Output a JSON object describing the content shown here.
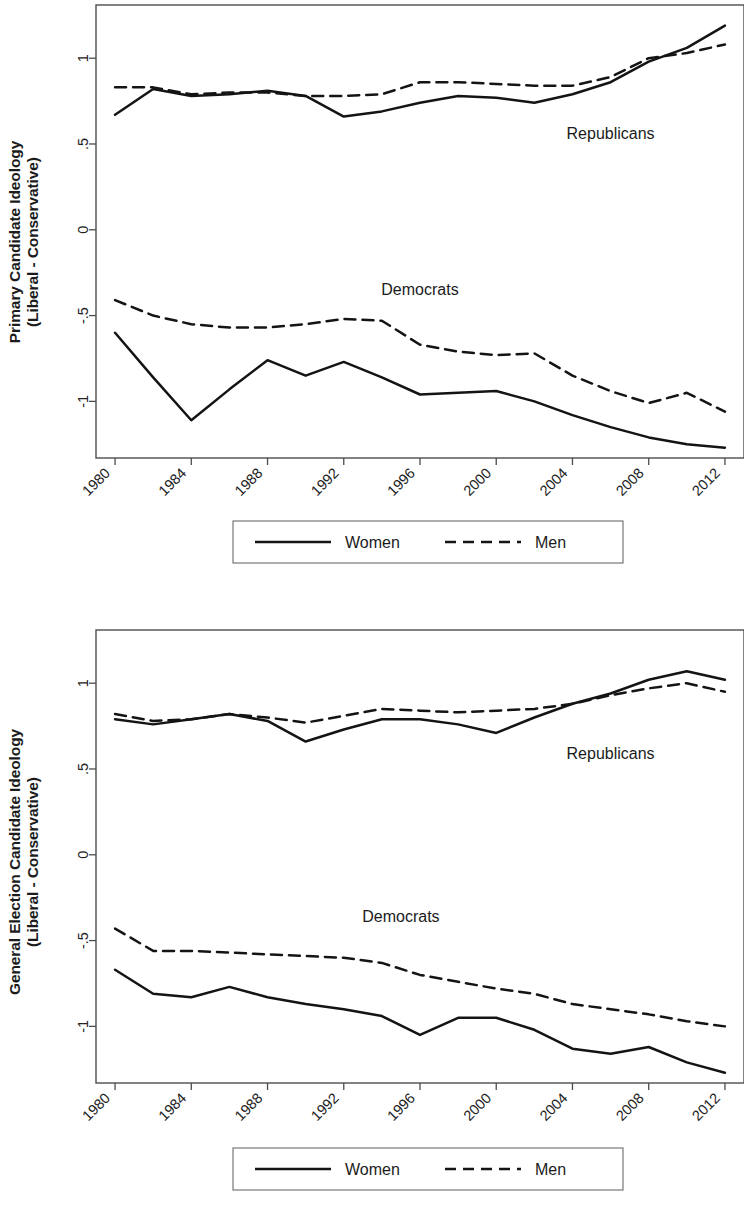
{
  "figure": {
    "background": "#ffffff",
    "line_color": "#141414",
    "frame_color": "#4d4d4d"
  },
  "panels": [
    {
      "id": "primary",
      "ylabel_line1": "Primary Candidate Ideology",
      "ylabel_line2": "(Liberal - Conservative)",
      "annotations": {
        "republicans": "Republicans",
        "democrats": "Democrats"
      },
      "legend": {
        "women": "Women",
        "men": "Men"
      },
      "yticks": [
        "1",
        ".5",
        "0",
        "-.5",
        "-1"
      ],
      "xticks": [
        "1980",
        "1984",
        "1988",
        "1992",
        "1996",
        "2000",
        "2004",
        "2008",
        "2012"
      ]
    },
    {
      "id": "general",
      "ylabel_line1": "General Election Candidate Ideology",
      "ylabel_line2": "(Liberal - Conservative)",
      "annotations": {
        "republicans": "Republicans",
        "democrats": "Democrats"
      },
      "legend": {
        "women": "Women",
        "men": "Men"
      },
      "yticks": [
        "1",
        ".5",
        "0",
        "-.5",
        "-1"
      ],
      "xticks": [
        "1980",
        "1984",
        "1988",
        "1992",
        "1996",
        "2000",
        "2004",
        "2008",
        "2012"
      ]
    }
  ],
  "chart_data": [
    {
      "type": "line",
      "title": "Primary Candidate Ideology (Liberal - Conservative)",
      "xlabel": "",
      "ylabel": "Primary Candidate Ideology (Liberal - Conservative)",
      "x": [
        1980,
        1982,
        1984,
        1986,
        1988,
        1990,
        1992,
        1994,
        1996,
        1998,
        2000,
        2002,
        2004,
        2006,
        2008,
        2010,
        2012
      ],
      "xlim": [
        1979,
        2013
      ],
      "ylim": [
        -1.33,
        1.31
      ],
      "yticks": [
        1,
        0.5,
        0,
        -0.5,
        -1
      ],
      "ytick_labels": [
        "1",
        ".5",
        "0",
        "-.5",
        "-1"
      ],
      "xticks": [
        1980,
        1984,
        1988,
        1992,
        1996,
        2000,
        2004,
        2008,
        2012
      ],
      "grid": false,
      "legend_position": "below-axes",
      "annotations": [
        {
          "text": "Republicans",
          "x": 2006,
          "y": 0.53
        },
        {
          "text": "Democrats",
          "x": 1996,
          "y": -0.38
        }
      ],
      "series": [
        {
          "name": "Republican Women",
          "group": "Republicans",
          "style": "solid",
          "legend": "Women",
          "values": [
            0.67,
            0.82,
            0.78,
            0.79,
            0.81,
            0.78,
            0.66,
            0.69,
            0.74,
            0.78,
            0.77,
            0.74,
            0.79,
            0.86,
            0.98,
            1.06,
            1.19
          ]
        },
        {
          "name": "Republican Men",
          "group": "Republicans",
          "style": "dashed",
          "legend": "Men",
          "values": [
            0.83,
            0.83,
            0.79,
            0.8,
            0.8,
            0.78,
            0.78,
            0.79,
            0.86,
            0.86,
            0.85,
            0.84,
            0.84,
            0.89,
            1.0,
            1.03,
            1.08
          ]
        },
        {
          "name": "Democratic Women",
          "group": "Democrats",
          "style": "solid",
          "legend": "Women",
          "values": [
            -0.6,
            -0.86,
            -1.11,
            -0.93,
            -0.76,
            -0.85,
            -0.77,
            -0.86,
            -0.96,
            -0.95,
            -0.94,
            -1.0,
            -1.08,
            -1.15,
            -1.21,
            -1.25,
            -1.27
          ]
        },
        {
          "name": "Democratic Men",
          "group": "Democrats",
          "style": "dashed",
          "legend": "Men",
          "values": [
            -0.41,
            -0.5,
            -0.55,
            -0.57,
            -0.57,
            -0.55,
            -0.52,
            -0.53,
            -0.67,
            -0.71,
            -0.73,
            -0.72,
            -0.85,
            -0.94,
            -1.01,
            -0.95,
            -1.06
          ]
        }
      ]
    },
    {
      "type": "line",
      "title": "General Election Candidate Ideology (Liberal - Conservative)",
      "xlabel": "",
      "ylabel": "General Election Candidate Ideology (Liberal - Conservative)",
      "x": [
        1980,
        1982,
        1984,
        1986,
        1988,
        1990,
        1992,
        1994,
        1996,
        1998,
        2000,
        2002,
        2004,
        2006,
        2008,
        2010,
        2012
      ],
      "xlim": [
        1979,
        2013
      ],
      "ylim": [
        -1.33,
        1.31
      ],
      "yticks": [
        1,
        0.5,
        0,
        -0.5,
        -1
      ],
      "ytick_labels": [
        "1",
        ".5",
        "0",
        "-.5",
        "-1"
      ],
      "xticks": [
        1980,
        1984,
        1988,
        1992,
        1996,
        2000,
        2004,
        2008,
        2012
      ],
      "grid": false,
      "legend_position": "below-axes",
      "annotations": [
        {
          "text": "Republicans",
          "x": 2006,
          "y": 0.56
        },
        {
          "text": "Democrats",
          "x": 1995,
          "y": -0.39
        }
      ],
      "series": [
        {
          "name": "Republican Women",
          "group": "Republicans",
          "style": "solid",
          "legend": "Women",
          "values": [
            0.79,
            0.76,
            0.79,
            0.82,
            0.78,
            0.66,
            0.73,
            0.79,
            0.79,
            0.76,
            0.71,
            0.8,
            0.88,
            0.94,
            1.02,
            1.07,
            1.02
          ]
        },
        {
          "name": "Republican Men",
          "group": "Republicans",
          "style": "dashed",
          "legend": "Men",
          "values": [
            0.82,
            0.78,
            0.79,
            0.82,
            0.8,
            0.77,
            0.81,
            0.85,
            0.84,
            0.83,
            0.84,
            0.85,
            0.88,
            0.93,
            0.97,
            1.0,
            0.95
          ]
        },
        {
          "name": "Democratic Women",
          "group": "Democrats",
          "style": "solid",
          "legend": "Women",
          "values": [
            -0.67,
            -0.81,
            -0.83,
            -0.77,
            -0.83,
            -0.87,
            -0.9,
            -0.94,
            -1.05,
            -0.95,
            -0.95,
            -1.02,
            -1.13,
            -1.16,
            -1.12,
            -1.21,
            -1.27
          ]
        },
        {
          "name": "Democratic Men",
          "group": "Democrats",
          "style": "dashed",
          "legend": "Men",
          "values": [
            -0.43,
            -0.56,
            -0.56,
            -0.57,
            -0.58,
            -0.59,
            -0.6,
            -0.63,
            -0.7,
            -0.74,
            -0.78,
            -0.81,
            -0.87,
            -0.9,
            -0.93,
            -0.97,
            -1.0
          ]
        }
      ]
    }
  ]
}
